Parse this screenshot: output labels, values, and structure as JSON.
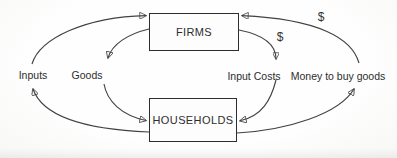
{
  "diagram": {
    "type": "circular-flow",
    "nodes": {
      "firms": {
        "label": "FIRMS"
      },
      "households": {
        "label": "HOUSEHOLDS"
      }
    },
    "labels": {
      "inputs": "Inputs",
      "goods": "Goods",
      "input_costs": "Input Costs",
      "money_to_buy_goods": "Money to buy goods",
      "dollar_inner": "$",
      "dollar_outer": "$"
    },
    "flows": [
      {
        "from": "HOUSEHOLDS",
        "to": "FIRMS",
        "label": "Inputs",
        "path": "outer-left"
      },
      {
        "from": "FIRMS",
        "to": "HOUSEHOLDS",
        "label": "Goods",
        "path": "inner-left"
      },
      {
        "from": "FIRMS",
        "to": "HOUSEHOLDS",
        "label": "Input Costs",
        "annotation": "$",
        "path": "inner-right"
      },
      {
        "from": "HOUSEHOLDS",
        "to": "FIRMS",
        "label": "Money to buy goods",
        "annotation": "$",
        "path": "outer-right"
      }
    ],
    "colors": {
      "background": "#fdfdfd",
      "stroke": "#424242",
      "text": "#2d2d2d"
    }
  }
}
